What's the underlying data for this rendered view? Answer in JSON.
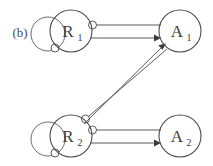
{
  "figure": {
    "panel_label": "(b)",
    "background_color": "#ffffff",
    "node_stroke_color": "#4a4a4a",
    "edge_stroke_color": "#5a5a5a",
    "arrow_fill_color": "#3a3a3a",
    "circle_head_fill_color": "#ffffff",
    "width": 213,
    "height": 166
  },
  "nodes": [
    {
      "id": "R1",
      "base": "R",
      "subscript": "1",
      "cx": 71,
      "cy": 31,
      "r": 21
    },
    {
      "id": "A1",
      "base": "A",
      "subscript": "1",
      "cx": 180,
      "cy": 31,
      "r": 21
    },
    {
      "id": "R2",
      "base": "R",
      "subscript": "2",
      "cx": 71,
      "cy": 136,
      "r": 21
    },
    {
      "id": "A2",
      "base": "A",
      "subscript": "2",
      "cx": 180,
      "cy": 136,
      "r": 21
    }
  ],
  "self_loops": [
    {
      "id": "R1-self-loop",
      "node": "R1",
      "head": "circle",
      "cx": 48,
      "cy": 34,
      "r": 17,
      "head_x": 55,
      "head_y": 48,
      "head_r": 4
    },
    {
      "id": "R2-self-loop",
      "node": "R2",
      "head": "circle",
      "cx": 48,
      "cy": 139,
      "r": 17,
      "head_x": 55,
      "head_y": 153,
      "head_r": 4
    }
  ],
  "edges": [
    {
      "id": "R1-to-A1-inhibit",
      "from": "R1",
      "to": "A1",
      "head": "circle",
      "label": ""
    },
    {
      "id": "R1-to-A1-activate",
      "from": "R1",
      "to": "A1",
      "head": "arrow",
      "label": ""
    },
    {
      "id": "R2-to-A1-inhibit",
      "from": "R2",
      "to": "A1",
      "head": "circle",
      "label": ""
    },
    {
      "id": "R2-to-A1-activate",
      "from": "R2",
      "to": "A1",
      "head": "arrow",
      "label": ""
    },
    {
      "id": "R2-to-A2-inhibit",
      "from": "R2",
      "to": "A2",
      "head": "circle",
      "label": ""
    },
    {
      "id": "R2-to-A2-activate",
      "from": "R2",
      "to": "A2",
      "head": "arrow",
      "label": ""
    }
  ]
}
